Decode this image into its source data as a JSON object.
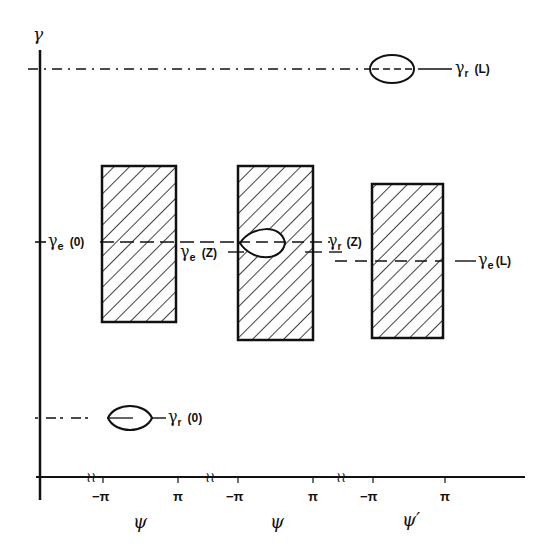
{
  "axes": {
    "y_label": "γ",
    "x_labels": [
      "ψ",
      "ψ",
      "ψ′"
    ],
    "ticks": [
      {
        "label": "−π",
        "x": 103
      },
      {
        "label": "π",
        "x": 178
      },
      {
        "label": "−π",
        "x": 238
      },
      {
        "label": "π",
        "x": 313
      },
      {
        "label": "−π",
        "x": 373
      },
      {
        "label": "π",
        "x": 445
      }
    ],
    "break_marks": [
      "≀≀",
      "≀≀",
      "≀≀"
    ]
  },
  "labels": {
    "gamma_r_L": {
      "main": "γ",
      "sub": "r",
      "arg": "(L)"
    },
    "gamma_e_0": {
      "main": "γ",
      "sub": "e",
      "arg": "(0)"
    },
    "gamma_e_Z": {
      "main": "γ",
      "sub": "e",
      "arg": "(Z)"
    },
    "gamma_r_Z": {
      "main": "γ",
      "sub": "r",
      "arg": "(Z)"
    },
    "gamma_e_L": {
      "main": "γ",
      "sub": "e",
      "arg": "(L)"
    },
    "gamma_r_0": {
      "main": "γ",
      "sub": "r",
      "arg": "(0)"
    }
  },
  "regions": [
    {
      "name": "hatched-region-0",
      "x": 102,
      "y": 166,
      "w": 74,
      "h": 156
    },
    {
      "name": "hatched-region-Z",
      "x": 238,
      "y": 166,
      "w": 75,
      "h": 174
    },
    {
      "name": "hatched-region-L",
      "x": 372,
      "y": 184,
      "w": 71,
      "h": 154
    }
  ]
}
